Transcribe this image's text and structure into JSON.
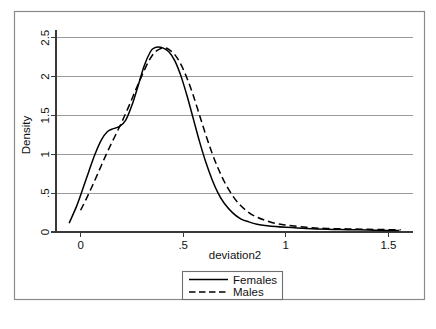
{
  "chart_data": {
    "type": "line",
    "title": "",
    "xlabel": "deviation2",
    "ylabel": "Density",
    "xlim": [
      -0.12,
      1.62
    ],
    "ylim": [
      0,
      2.6
    ],
    "grid": true,
    "legend_position": "bottom-center",
    "xticks": [
      "0",
      ".5",
      "1",
      "1.5"
    ],
    "xtick_values": [
      0,
      0.5,
      1,
      1.5
    ],
    "yticks": [
      "0",
      ".5",
      "1",
      "1.5",
      "2",
      "2.5"
    ],
    "ytick_values": [
      0,
      0.5,
      1,
      1.5,
      2,
      2.5
    ],
    "series": [
      {
        "name": "Females",
        "style": "solid",
        "color": "#000000",
        "x": [
          -0.055,
          -0.02,
          0.01,
          0.04,
          0.07,
          0.1,
          0.13,
          0.16,
          0.19,
          0.22,
          0.25,
          0.28,
          0.31,
          0.34,
          0.36,
          0.38,
          0.4,
          0.43,
          0.46,
          0.49,
          0.52,
          0.55,
          0.58,
          0.61,
          0.64,
          0.67,
          0.7,
          0.74,
          0.78,
          0.82,
          0.86,
          0.9,
          0.95,
          1.0,
          1.1,
          1.2,
          1.3,
          1.4,
          1.5,
          1.55
        ],
        "y": [
          0.12,
          0.33,
          0.55,
          0.78,
          1.0,
          1.18,
          1.29,
          1.33,
          1.36,
          1.44,
          1.63,
          1.88,
          2.14,
          2.32,
          2.37,
          2.38,
          2.37,
          2.32,
          2.2,
          2.0,
          1.74,
          1.45,
          1.16,
          0.9,
          0.68,
          0.5,
          0.37,
          0.25,
          0.17,
          0.13,
          0.1,
          0.085,
          0.07,
          0.06,
          0.045,
          0.035,
          0.03,
          0.025,
          0.02,
          0.018
        ]
      },
      {
        "name": "Males",
        "style": "dashed",
        "color": "#000000",
        "x": [
          0.0,
          0.03,
          0.06,
          0.09,
          0.12,
          0.15,
          0.18,
          0.21,
          0.24,
          0.27,
          0.3,
          0.33,
          0.36,
          0.39,
          0.41,
          0.43,
          0.46,
          0.49,
          0.52,
          0.55,
          0.58,
          0.61,
          0.64,
          0.67,
          0.7,
          0.74,
          0.78,
          0.82,
          0.86,
          0.9,
          0.95,
          1.0,
          1.1,
          1.2,
          1.3,
          1.4,
          1.5,
          1.56
        ],
        "y": [
          0.28,
          0.44,
          0.61,
          0.79,
          0.97,
          1.14,
          1.3,
          1.47,
          1.65,
          1.84,
          2.02,
          2.19,
          2.31,
          2.36,
          2.37,
          2.35,
          2.28,
          2.15,
          1.97,
          1.75,
          1.5,
          1.25,
          1.02,
          0.82,
          0.65,
          0.47,
          0.34,
          0.25,
          0.19,
          0.15,
          0.11,
          0.09,
          0.06,
          0.045,
          0.04,
          0.035,
          0.03,
          0.028
        ]
      }
    ],
    "legend": [
      {
        "label": "Females",
        "style": "solid"
      },
      {
        "label": "Males",
        "style": "dashed"
      }
    ]
  },
  "colors": {
    "grid": "#9a9a9a",
    "axis": "#3a3a3a",
    "curve": "#000000",
    "frame": "#8a8a8a",
    "background": "#ffffff"
  }
}
